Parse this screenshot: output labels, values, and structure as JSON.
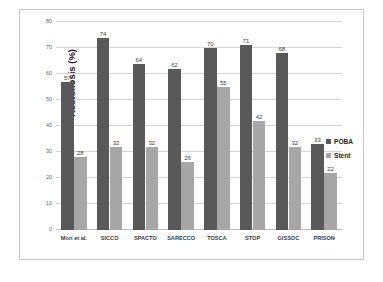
{
  "chart_data": {
    "type": "bar",
    "title": "",
    "xlabel": "",
    "ylabel": "Restenosis (%)",
    "ylim": [
      0,
      80
    ],
    "ytick_step": 10,
    "yticks": [
      0,
      10,
      20,
      30,
      40,
      50,
      60,
      70,
      80
    ],
    "grid": true,
    "legend_position": "right",
    "categories": [
      "Mori et al.",
      "SICCO",
      "SPACTO",
      "SARECCO",
      "TOSCA",
      "STOP",
      "GISSOC",
      "PRISON"
    ],
    "series": [
      {
        "name": "POBA",
        "color": "#595959",
        "values": [
          57,
          74,
          64,
          62,
          70,
          71,
          68,
          33
        ]
      },
      {
        "name": "Stent",
        "color": "#a6a6a6",
        "values": [
          28,
          32,
          32,
          26,
          55,
          42,
          32,
          22
        ]
      }
    ]
  },
  "legend": {
    "items": [
      {
        "label": "POBA",
        "swatch": "poba"
      },
      {
        "label": "Stent",
        "swatch": "stent"
      }
    ]
  },
  "colors": {
    "poba": "#595959",
    "stent": "#a6a6a6",
    "gridline": "#d4d4d4",
    "frame_border": "#c8c8c8",
    "background": "#ffffff"
  }
}
